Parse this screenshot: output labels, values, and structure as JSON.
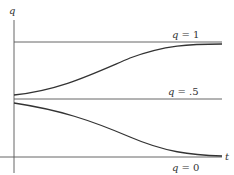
{
  "diagram": {
    "y_axis_label": "q",
    "x_axis_label": "t",
    "lines": [
      {
        "label_var": "q",
        "label_eq": "= 1"
      },
      {
        "label_var": "q",
        "label_eq": "= .5"
      },
      {
        "label_var": "q",
        "label_eq": "= 0"
      }
    ],
    "colors": {
      "stroke": "#444444",
      "text": "#333333"
    }
  }
}
